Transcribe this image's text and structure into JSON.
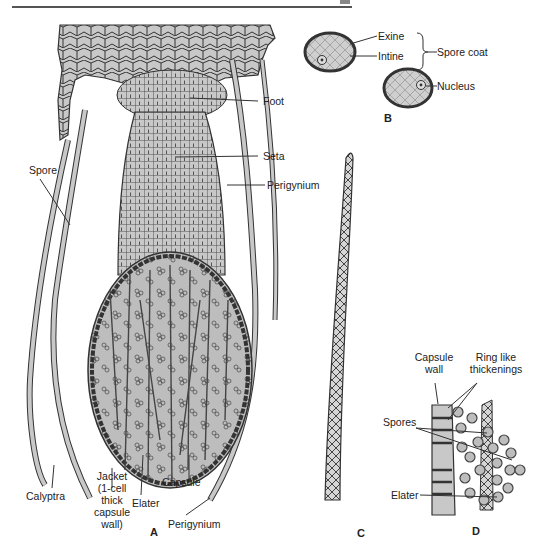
{
  "figure": {
    "panels": {
      "A": {
        "letter": "A",
        "labels": {
          "foot": "Foot",
          "seta": "Seta",
          "perigynium_top": "Perigynium",
          "spore": "Spore",
          "calyptra": "Calyptra",
          "jacket_line1": "Jacket",
          "jacket_line2": "(1-cell",
          "jacket_line3": "thick",
          "jacket_line4": "capsule",
          "jacket_line5": "wall)",
          "elater": "Elater",
          "capsule": "Capsule",
          "perigynium_bottom": "Perigynium"
        }
      },
      "B": {
        "letter": "B",
        "labels": {
          "exine": "Exine",
          "intine": "Intine",
          "spore_coat": "Spore coat",
          "nucleus": "Nucleus"
        }
      },
      "C": {
        "letter": "C"
      },
      "D": {
        "letter": "D",
        "labels": {
          "capsule_wall_line1": "Capsule",
          "capsule_wall_line2": "wall",
          "ring_line1": "Ring like",
          "ring_line2": "thickenings",
          "spores": "Spores",
          "elater": "Elater"
        }
      }
    },
    "colors": {
      "cell_fill": "#c8c8c8",
      "outline": "#333333",
      "capsule_fill": "#bdbdbd",
      "background": "#ffffff"
    }
  }
}
